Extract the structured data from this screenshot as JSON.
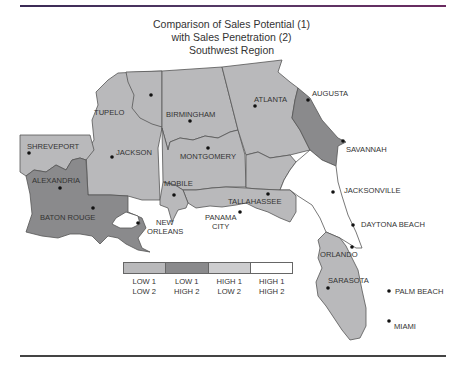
{
  "title": {
    "line1": "Comparison of Sales Potential (1)",
    "line2": "with Sales Penetration (2)",
    "line3": "Southwest Region"
  },
  "colors": {
    "low1_low2": "#b9b9bb",
    "low1_high2": "#8a8a8c",
    "high1_low2": "#cdcdcf",
    "high1_high2": "#ffffff",
    "outline": "#555555"
  },
  "cities": [
    {
      "name": "TUPELO",
      "category": "low1_low2"
    },
    {
      "name": "BIRMINGHAM",
      "category": "low1_low2"
    },
    {
      "name": "ATLANTA",
      "category": "low1_low2"
    },
    {
      "name": "AUGUSTA",
      "category": "low1_high2"
    },
    {
      "name": "SHREVEPORT",
      "category": "low1_low2"
    },
    {
      "name": "JACKSON",
      "category": "low1_low2"
    },
    {
      "name": "MONTGOMERY",
      "category": "low1_low2"
    },
    {
      "name": "SAVANNAH",
      "category": "low1_high2"
    },
    {
      "name": "ALEXANDRIA",
      "category": "low1_high2"
    },
    {
      "name": "MOBILE",
      "category": "low1_low2"
    },
    {
      "name": "TALLAHASSEE",
      "category": "low1_low2"
    },
    {
      "name": "JACKSONVILLE",
      "category": "high1_high2"
    },
    {
      "name": "BATON ROUGE",
      "category": "low1_high2"
    },
    {
      "name": "NEW ORLEANS",
      "category": "low1_high2"
    },
    {
      "name": "PANAMA CITY",
      "category": "low1_low2"
    },
    {
      "name": "DAYTONA BEACH",
      "category": "high1_high2"
    },
    {
      "name": "ORLANDO",
      "category": "low1_low2"
    },
    {
      "name": "SARASOTA",
      "category": "low1_low2"
    },
    {
      "name": "PALM BEACH",
      "category": "low1_low2"
    },
    {
      "name": "MIAMI",
      "category": "low1_low2"
    }
  ],
  "labels": {
    "tupelo": "TUPELO",
    "birmingham": "BIRMINGHAM",
    "atlanta": "ATLANTA",
    "augusta": "AUGUSTA",
    "shreveport": "SHREVEPORT",
    "jackson": "JACKSON",
    "montgomery": "MONTGOMERY",
    "savannah": "SAVANNAH",
    "alexandria": "ALEXANDRIA",
    "mobile": "MOBILE",
    "tallahassee": "TALLAHASSEE",
    "jacksonville": "JACKSONVILLE",
    "baton_rouge": "BATON ROUGE",
    "new": "NEW",
    "orleans": "ORLEANS",
    "panama": "PANAMA",
    "city": "CITY",
    "daytona_beach": "DAYTONA BEACH",
    "orlando": "ORLANDO",
    "sarasota": "SARASOTA",
    "palm_beach": "PALM BEACH",
    "miami": "MIAMI"
  },
  "legend": [
    {
      "line1": "LOW 1",
      "line2": "LOW 2",
      "color": "#b9b9bb"
    },
    {
      "line1": "LOW 1",
      "line2": "HIGH 2",
      "color": "#8a8a8c"
    },
    {
      "line1": "HIGH 1",
      "line2": "LOW 2",
      "color": "#cdcdcf"
    },
    {
      "line1": "HIGH 1",
      "line2": "HIGH 2",
      "color": "#ffffff"
    }
  ]
}
